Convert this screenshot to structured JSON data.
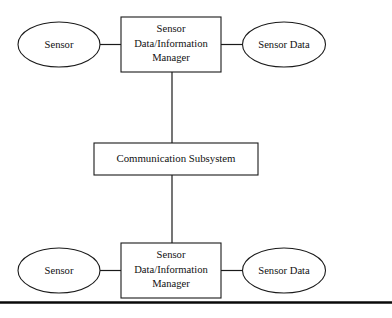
{
  "diagram": {
    "background_color": "#ffffff",
    "stroke_color": "#1a1a1a",
    "text_color": "#111111",
    "nodes": {
      "top_sensor": {
        "label": "Sensor",
        "shape": "ellipse"
      },
      "top_manager": {
        "line1": "Sensor",
        "line2": "Data/Information",
        "line3": "Manager",
        "shape": "rectangle"
      },
      "top_sensor_data": {
        "label": "Sensor Data",
        "shape": "ellipse"
      },
      "communication_subsystem": {
        "label": "Communication Subsystem",
        "shape": "rectangle"
      },
      "bottom_sensor": {
        "label": "Sensor",
        "shape": "ellipse"
      },
      "bottom_manager": {
        "line1": "Sensor",
        "line2": "Data/Information",
        "line3": "Manager",
        "shape": "rectangle"
      },
      "bottom_sensor_data": {
        "label": "Sensor Data",
        "shape": "ellipse"
      }
    },
    "connectors": [
      {
        "name": "top-sensor-to-manager",
        "orientation": "horizontal"
      },
      {
        "name": "top-manager-to-sensor-data",
        "orientation": "horizontal"
      },
      {
        "name": "top-manager-to-communication",
        "orientation": "vertical"
      },
      {
        "name": "communication-to-bottom-manager",
        "orientation": "vertical"
      },
      {
        "name": "bottom-sensor-to-manager",
        "orientation": "horizontal"
      },
      {
        "name": "bottom-manager-to-sensor-data",
        "orientation": "horizontal"
      }
    ],
    "baseline_rule": {
      "name": "page-footer-rule"
    }
  }
}
